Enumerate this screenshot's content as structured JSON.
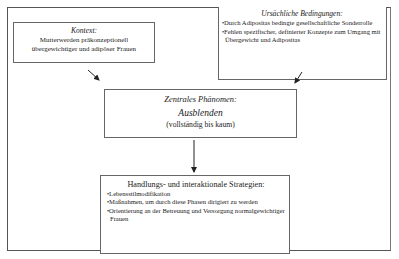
{
  "diagram": {
    "context_box": {
      "title": "Kontext:",
      "lines": [
        "Mutterwerden präkonzeptionell",
        "übergewichtiger und adipöser Frauen"
      ]
    },
    "causal_box": {
      "title": "Ursächliche Bedingungen:",
      "bullets": [
        "Durch Adipositas bedingte gesellschaftliche Sonderrolle",
        "Fehlen spezifischer, definierter Konzepte zum Umgang mit Übergewicht und Adipositas"
      ]
    },
    "central_box": {
      "title": "Zentrales Phänomen:",
      "phenomenon": "Ausblenden",
      "qualifier": "(vollständig bis kaum)"
    },
    "strategies_box": {
      "title": "Handlungs- und interaktionale Strategien:",
      "bullets": [
        "Lebensstilmodifikation",
        "Maßnahmen, um durch diese Phasen dirigiert zu werden",
        "Orientierung an der Betreuung und Versorgung normalgewichtiger Frauen"
      ]
    },
    "edges": [
      {
        "from": "context_box",
        "to": "central_box"
      },
      {
        "from": "causal_box",
        "to": "central_box"
      },
      {
        "from": "central_box",
        "to": "strategies_box"
      }
    ]
  }
}
